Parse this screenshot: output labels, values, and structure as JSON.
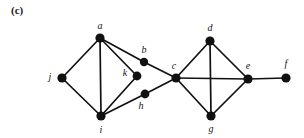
{
  "figure": {
    "panel_label": "(c)",
    "width": 304,
    "height": 138,
    "background_color": "#ffffff",
    "edge_color": "#111111",
    "vertex_color": "#111111",
    "label_color": "#141414"
  },
  "graph": {
    "type": "undirected-graph",
    "vertex_count": 11,
    "edge_count": 16,
    "vertices": [
      {
        "id": "a",
        "label": "a",
        "x": 100,
        "y": 38,
        "r": 4.6,
        "label_x": 100,
        "label_y": 26
      },
      {
        "id": "b",
        "label": "b",
        "x": 144,
        "y": 62,
        "r": 4.2,
        "label_x": 144,
        "label_y": 50
      },
      {
        "id": "c",
        "label": "c",
        "x": 176,
        "y": 78,
        "r": 4.6,
        "label_x": 174,
        "label_y": 66
      },
      {
        "id": "d",
        "label": "d",
        "x": 210,
        "y": 41,
        "r": 4.6,
        "label_x": 210,
        "label_y": 28
      },
      {
        "id": "e",
        "label": "e",
        "x": 248,
        "y": 79,
        "r": 4.6,
        "label_x": 248,
        "label_y": 66
      },
      {
        "id": "f",
        "label": "f",
        "x": 286,
        "y": 78,
        "r": 4.6,
        "label_x": 286,
        "label_y": 64
      },
      {
        "id": "g",
        "label": "g",
        "x": 211,
        "y": 116,
        "r": 4.6,
        "label_x": 211,
        "label_y": 129
      },
      {
        "id": "h",
        "label": "h",
        "x": 145,
        "y": 94,
        "r": 4.4,
        "label_x": 141,
        "label_y": 106
      },
      {
        "id": "i",
        "label": "i",
        "x": 101,
        "y": 116,
        "r": 4.6,
        "label_x": 101,
        "label_y": 130
      },
      {
        "id": "j",
        "label": "j",
        "x": 62,
        "y": 78,
        "r": 4.6,
        "label_x": 50,
        "label_y": 77
      },
      {
        "id": "k",
        "label": "k",
        "x": 137,
        "y": 76,
        "r": 4.4,
        "label_x": 125,
        "label_y": 73
      }
    ],
    "edges": [
      {
        "from": "j",
        "to": "a"
      },
      {
        "from": "j",
        "to": "i"
      },
      {
        "from": "a",
        "to": "i"
      },
      {
        "from": "a",
        "to": "k"
      },
      {
        "from": "a",
        "to": "b"
      },
      {
        "from": "i",
        "to": "k"
      },
      {
        "from": "i",
        "to": "h"
      },
      {
        "from": "b",
        "to": "c"
      },
      {
        "from": "h",
        "to": "c"
      },
      {
        "from": "c",
        "to": "d"
      },
      {
        "from": "c",
        "to": "g"
      },
      {
        "from": "c",
        "to": "e"
      },
      {
        "from": "d",
        "to": "e"
      },
      {
        "from": "d",
        "to": "g"
      },
      {
        "from": "g",
        "to": "e"
      },
      {
        "from": "e",
        "to": "f"
      }
    ]
  }
}
